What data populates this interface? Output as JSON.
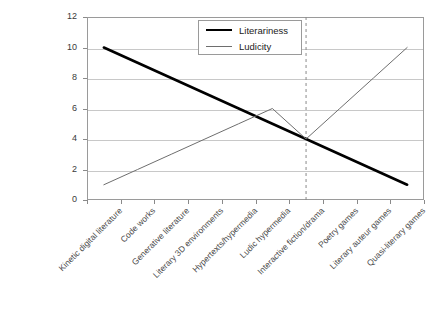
{
  "chart_data": {
    "type": "line",
    "title": "",
    "xlabel": "",
    "ylabel": "",
    "ylim": [
      0,
      12
    ],
    "yticks": [
      0,
      2,
      4,
      6,
      8,
      10,
      12
    ],
    "grid": true,
    "legend_position": "top-center",
    "categories": [
      "Kinetic digital literature",
      "Code works",
      "Generative literature",
      "Literary 3D environments",
      "Hypertexts/hypermedia",
      "Ludic hypermedia",
      "Interactive fiction/drama",
      "Poetry games",
      "Literary auteur games",
      "Quasi-literary games"
    ],
    "series": [
      {
        "name": "Literariness",
        "values": [
          10,
          9,
          8,
          7,
          6,
          5,
          4,
          3,
          2,
          1
        ],
        "color": "#000000",
        "width": 2.6
      },
      {
        "name": "Ludicity",
        "values": [
          1,
          2,
          3,
          4,
          5,
          6,
          4,
          6,
          8,
          10
        ],
        "color": "#6e6e6e",
        "width": 1.0
      }
    ],
    "annotations": [
      {
        "type": "vertical-dashed-line",
        "at_category": "Interactive fiction/drama",
        "value": 4,
        "color": "#8a8a8a"
      }
    ]
  },
  "legend": {
    "entries": [
      {
        "label": "Literariness"
      },
      {
        "label": "Ludicity"
      }
    ]
  },
  "axis": {
    "y_tick_labels": [
      "0",
      "2",
      "4",
      "6",
      "8",
      "10",
      "12"
    ]
  },
  "colors": {
    "grid": "#c8c8c8",
    "frame": "#9a9a9a",
    "literariness": "#000000",
    "ludicity": "#6e6e6e",
    "dashed_marker": "#8a8a8a"
  }
}
